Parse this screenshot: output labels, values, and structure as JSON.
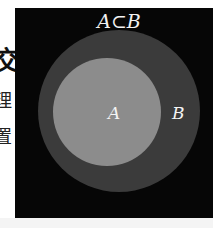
{
  "side_text": {
    "chars": [
      "交",
      "理",
      "置"
    ]
  },
  "diagram": {
    "title": "A⊂B",
    "circles": [
      {
        "name": "B",
        "role": "outer",
        "color": "#3b3b3b"
      },
      {
        "name": "A",
        "role": "inner",
        "color": "#8c8c8c"
      }
    ],
    "labels": {
      "a": "A",
      "b": "B"
    },
    "background": "#060606"
  }
}
